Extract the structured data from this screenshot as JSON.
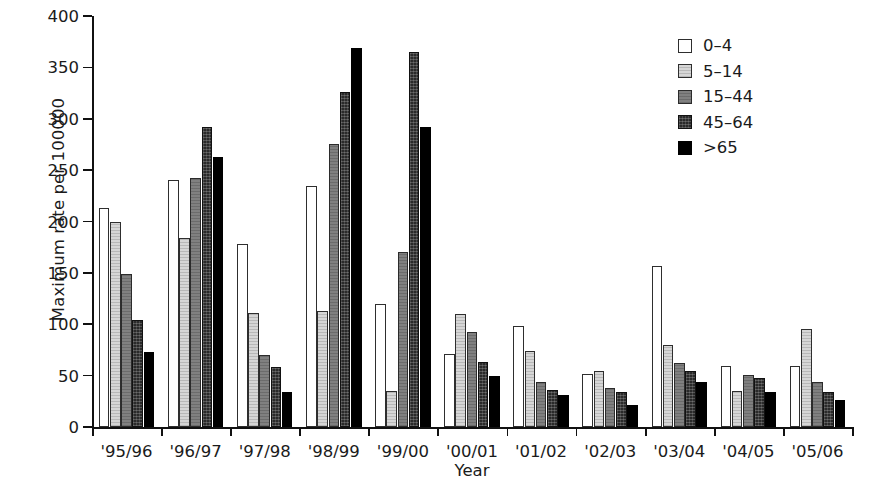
{
  "chart_data": {
    "type": "bar",
    "title": "",
    "xlabel": "Year",
    "ylabel": "Maximum rate per 100000",
    "ylim": [
      0,
      400
    ],
    "ytick_values": [
      0,
      50,
      100,
      150,
      200,
      250,
      300,
      350,
      400
    ],
    "ytick_labels": [
      "0",
      "50",
      "100",
      "150",
      "200",
      "250",
      "300",
      "350",
      "400"
    ],
    "grid": false,
    "legend_position": "top-right",
    "categories": [
      "'95/96",
      "'96/97",
      "'97/98",
      "'98/99",
      "'99/00",
      "'00/01",
      "'01/02",
      "'02/03",
      "'03/04",
      "'04/05",
      "'05/06"
    ],
    "series": [
      {
        "name": "0-4",
        "color": "#ffffff",
        "values": [
          213,
          240,
          178,
          235,
          120,
          71,
          98,
          52,
          157,
          59,
          59
        ]
      },
      {
        "name": "5-14",
        "color": "#d6d6d6",
        "values": [
          200,
          184,
          111,
          113,
          35,
          110,
          74,
          55,
          80,
          35,
          95
        ]
      },
      {
        "name": "15-44",
        "color": "#808080",
        "values": [
          149,
          242,
          70,
          275,
          170,
          92,
          44,
          38,
          62,
          51,
          44
        ]
      },
      {
        "name": "45-64",
        "color": "#2a2a2a",
        "values": [
          104,
          292,
          58,
          326,
          365,
          63,
          36,
          34,
          55,
          48,
          34
        ]
      },
      {
        "name": ">65",
        "color": "#000000",
        "values": [
          73,
          263,
          34,
          369,
          292,
          50,
          31,
          21,
          44,
          34,
          26
        ]
      }
    ]
  },
  "legend": {
    "items": [
      {
        "label": "0–4"
      },
      {
        "label": "5–14"
      },
      {
        "label": "15–44"
      },
      {
        "label": "45–64"
      },
      {
        "label": ">65"
      }
    ]
  }
}
